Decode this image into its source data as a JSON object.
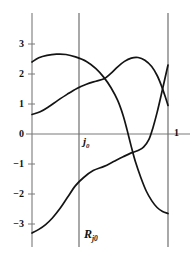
{
  "chart_data": {
    "type": "line",
    "title": "",
    "xlabel": "",
    "ylabel": "",
    "xlim": [
      0,
      1
    ],
    "ylim": [
      -3.55,
      3.55
    ],
    "grid": false,
    "legend": null,
    "y_ticks": [
      {
        "value": 3,
        "label": "3"
      },
      {
        "value": 2,
        "label": "2"
      },
      {
        "value": 1,
        "label": "1"
      },
      {
        "value": 0,
        "label": "0"
      },
      {
        "value": -1,
        "label": "−1"
      },
      {
        "value": -2,
        "label": "−2"
      },
      {
        "value": -3,
        "label": "−3"
      }
    ],
    "x_ticks": [
      {
        "value": 1,
        "label": "1"
      }
    ],
    "vertical_lines": [
      {
        "x": 0.53,
        "label": "j0"
      },
      {
        "x": 1.0,
        "label": "1"
      }
    ],
    "annotations": [
      {
        "name": "j0",
        "text": "j",
        "sub": "0",
        "x": 0.55,
        "y": -0.35
      },
      {
        "name": "Rj0",
        "text": "R",
        "sub": "j0",
        "x": 0.55,
        "y": -2.85
      }
    ],
    "series": [
      {
        "name": "arch-descending",
        "comment": "starts ~2.40 at left, peaks ~2.65, falls steeply past j0, ends ~-2.65 at right",
        "points": [
          [
            0.0,
            2.4
          ],
          [
            0.05,
            2.54
          ],
          [
            0.11,
            2.62
          ],
          [
            0.18,
            2.66
          ],
          [
            0.25,
            2.65
          ],
          [
            0.32,
            2.57
          ],
          [
            0.4,
            2.42
          ],
          [
            0.47,
            2.18
          ],
          [
            0.53,
            1.88
          ],
          [
            0.58,
            1.55
          ],
          [
            0.63,
            1.12
          ],
          [
            0.67,
            0.62
          ],
          [
            0.7,
            0.12
          ],
          [
            0.73,
            -0.42
          ],
          [
            0.76,
            -0.92
          ],
          [
            0.8,
            -1.45
          ],
          [
            0.84,
            -1.9
          ],
          [
            0.88,
            -2.22
          ],
          [
            0.92,
            -2.45
          ],
          [
            0.96,
            -2.58
          ],
          [
            1.0,
            -2.65
          ]
        ]
      },
      {
        "name": "rising-arch",
        "comment": "starts ~0.65 at left, rises through j0 ~1.80, peaks ~2.55, ends ~0.95 at right",
        "points": [
          [
            0.0,
            0.65
          ],
          [
            0.06,
            0.74
          ],
          [
            0.12,
            0.9
          ],
          [
            0.19,
            1.12
          ],
          [
            0.26,
            1.33
          ],
          [
            0.33,
            1.52
          ],
          [
            0.4,
            1.66
          ],
          [
            0.47,
            1.76
          ],
          [
            0.53,
            1.84
          ],
          [
            0.58,
            2.02
          ],
          [
            0.63,
            2.24
          ],
          [
            0.68,
            2.42
          ],
          [
            0.73,
            2.53
          ],
          [
            0.78,
            2.55
          ],
          [
            0.83,
            2.46
          ],
          [
            0.88,
            2.25
          ],
          [
            0.92,
            1.95
          ],
          [
            0.95,
            1.63
          ],
          [
            0.98,
            1.24
          ],
          [
            1.0,
            0.95
          ]
        ]
      },
      {
        "name": "s-curve-rising",
        "comment": "starts ~-3.30 bottom left, S-shape through j0 ~-1.08, plateau ~-0.60, sweeps up to ~2.30 at right",
        "points": [
          [
            0.0,
            -3.3
          ],
          [
            0.05,
            -3.18
          ],
          [
            0.1,
            -3.02
          ],
          [
            0.15,
            -2.8
          ],
          [
            0.2,
            -2.52
          ],
          [
            0.26,
            -2.12
          ],
          [
            0.32,
            -1.72
          ],
          [
            0.38,
            -1.45
          ],
          [
            0.45,
            -1.22
          ],
          [
            0.53,
            -1.08
          ],
          [
            0.6,
            -0.92
          ],
          [
            0.67,
            -0.76
          ],
          [
            0.73,
            -0.63
          ],
          [
            0.78,
            -0.55
          ],
          [
            0.82,
            -0.44
          ],
          [
            0.86,
            -0.18
          ],
          [
            0.89,
            0.22
          ],
          [
            0.92,
            0.72
          ],
          [
            0.95,
            1.3
          ],
          [
            0.98,
            1.9
          ],
          [
            1.0,
            2.3
          ]
        ]
      }
    ]
  }
}
